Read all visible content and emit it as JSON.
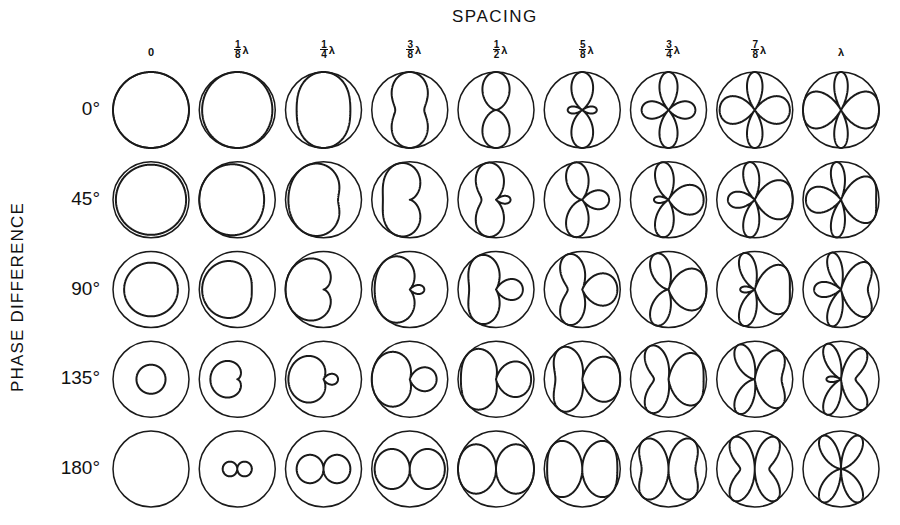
{
  "figure": {
    "title": "SPACING",
    "row_axis_label": "PHASE DIFFERENCE",
    "columns": [
      {
        "label": "0",
        "num": null,
        "den": null,
        "lambda": false,
        "spacing_wavelengths": 0
      },
      {
        "label": "1/8 λ",
        "num": "1",
        "den": "8",
        "lambda": true,
        "spacing_wavelengths": 0.125
      },
      {
        "label": "1/4 λ",
        "num": "1",
        "den": "4",
        "lambda": true,
        "spacing_wavelengths": 0.25
      },
      {
        "label": "3/8 λ",
        "num": "3",
        "den": "8",
        "lambda": true,
        "spacing_wavelengths": 0.375
      },
      {
        "label": "1/2 λ",
        "num": "1",
        "den": "2",
        "lambda": true,
        "spacing_wavelengths": 0.5
      },
      {
        "label": "5/8 λ",
        "num": "5",
        "den": "8",
        "lambda": true,
        "spacing_wavelengths": 0.625
      },
      {
        "label": "3/4 λ",
        "num": "3",
        "den": "4",
        "lambda": true,
        "spacing_wavelengths": 0.75
      },
      {
        "label": "7/8 λ",
        "num": "7",
        "den": "8",
        "lambda": true,
        "spacing_wavelengths": 0.875
      },
      {
        "label": "λ",
        "num": null,
        "den": null,
        "lambda": true,
        "spacing_wavelengths": 1.0
      }
    ],
    "rows": [
      {
        "label": "0°",
        "phase_deg": 0
      },
      {
        "label": "45°",
        "phase_deg": 45
      },
      {
        "label": "90°",
        "phase_deg": 90
      },
      {
        "label": "135°",
        "phase_deg": 135
      },
      {
        "label": "180°",
        "phase_deg": 180
      }
    ],
    "colors": {
      "ink": "#1a1a1a",
      "background": "#ffffff"
    }
  },
  "chart_data": {
    "type": "polar-grid",
    "title": "SPACING",
    "xlabel": "Spacing (element separation)",
    "ylabel": "PHASE DIFFERENCE",
    "categories_x": [
      "0",
      "1/8 λ",
      "1/4 λ",
      "3/8 λ",
      "1/2 λ",
      "5/8 λ",
      "3/4 λ",
      "7/8 λ",
      "λ"
    ],
    "categories_y": [
      "0°",
      "45°",
      "90°",
      "135°",
      "180°"
    ],
    "pattern_formula": "r(φ) = |cos(π·d/λ·cos φ + δ/2)|, elements along horizontal axis, outer circle = unity",
    "peak_relative_amplitude_at_zero_spacing": {
      "0°": 1.0,
      "45°": 0.924,
      "90°": 0.707,
      "135°": 0.383,
      "180°": 0.0
    }
  }
}
